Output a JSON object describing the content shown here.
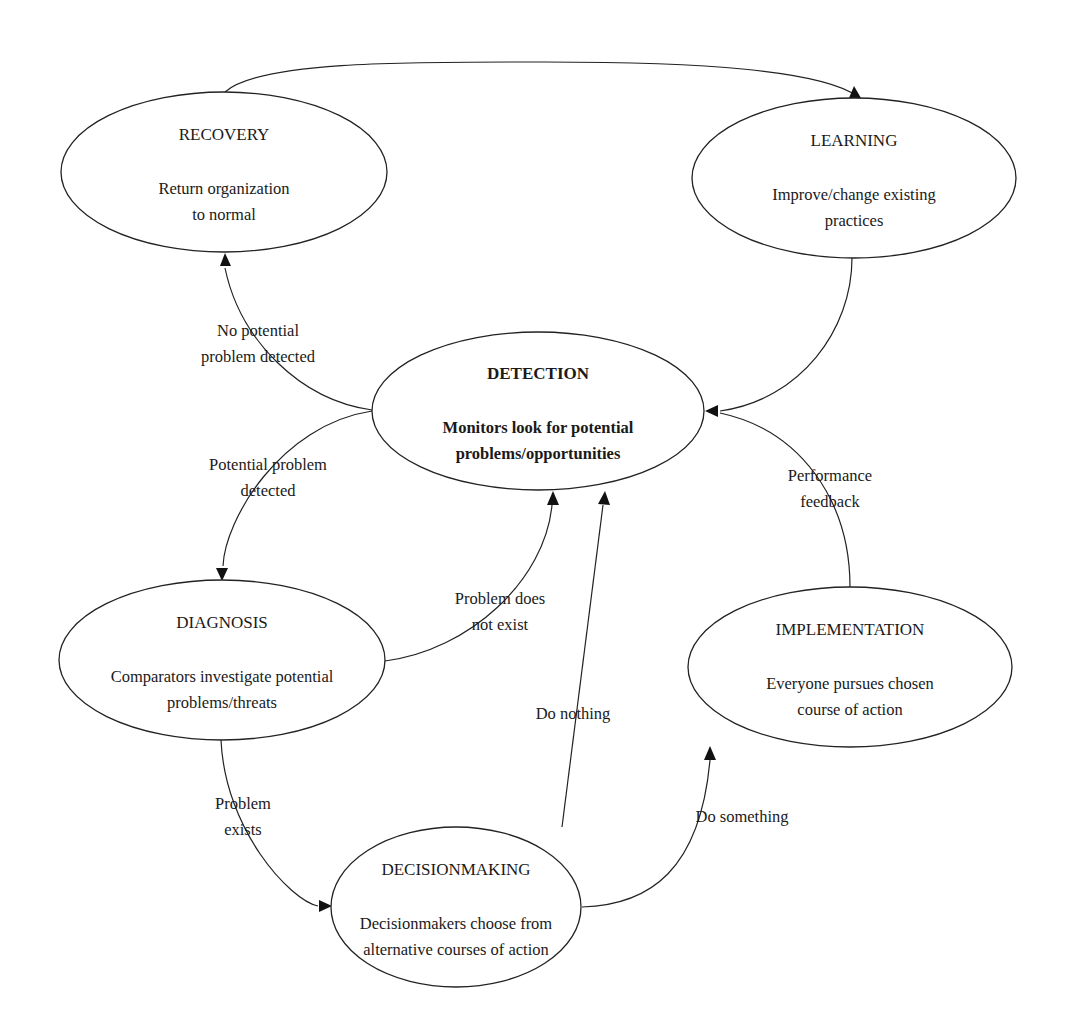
{
  "diagram": {
    "type": "cycle-flow",
    "nodes": {
      "recovery": {
        "title": "RECOVERY",
        "desc1": "Return organization",
        "desc2": "to normal"
      },
      "learning": {
        "title": "LEARNING",
        "desc1": "Improve/change existing",
        "desc2": "practices"
      },
      "detection": {
        "title": "DETECTION",
        "desc1": "Monitors look for potential",
        "desc2": "problems/opportunities"
      },
      "diagnosis": {
        "title": "DIAGNOSIS",
        "desc1": "Comparators investigate potential",
        "desc2": "problems/threats"
      },
      "implementation": {
        "title": "IMPLEMENTATION",
        "desc1": "Everyone pursues chosen",
        "desc2": "course of action"
      },
      "decisionmaking": {
        "title": "DECISIONMAKING",
        "desc1": "Decisionmakers choose from",
        "desc2": "alternative courses of action"
      }
    },
    "edges": {
      "recovery_to_learning": {
        "from": "RECOVERY",
        "to": "LEARNING",
        "label": ""
      },
      "learning_to_detection": {
        "from": "LEARNING",
        "to": "DETECTION",
        "label": ""
      },
      "detection_to_recovery": {
        "from": "DETECTION",
        "to": "RECOVERY",
        "label1": "No potential",
        "label2": "problem detected"
      },
      "detection_to_diagnosis": {
        "from": "DETECTION",
        "to": "DIAGNOSIS",
        "label1": "Potential problem",
        "label2": "detected"
      },
      "diagnosis_to_detection": {
        "from": "DIAGNOSIS",
        "to": "DETECTION",
        "label1": "Problem does",
        "label2": "not exist"
      },
      "diagnosis_to_decisionmaking": {
        "from": "DIAGNOSIS",
        "to": "DECISIONMAKING",
        "label1": "Problem",
        "label2": "exists"
      },
      "decisionmaking_to_detection": {
        "from": "DECISIONMAKING",
        "to": "DETECTION",
        "label": "Do nothing"
      },
      "decisionmaking_to_implementation": {
        "from": "DECISIONMAKING",
        "to": "IMPLEMENTATION",
        "label": "Do something"
      },
      "implementation_to_detection": {
        "from": "IMPLEMENTATION",
        "to": "DETECTION",
        "label1": "Performance",
        "label2": "feedback"
      }
    }
  }
}
